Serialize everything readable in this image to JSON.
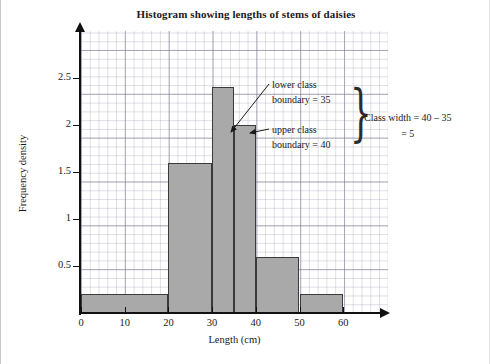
{
  "chart_data": {
    "type": "bar",
    "title": "Histogram showing lengths of stems of daisies",
    "xlabel": "Length (cm)",
    "ylabel": "Frequency density",
    "xlim": [
      0,
      60
    ],
    "ylim": [
      0,
      2.75
    ],
    "grid": true,
    "legend": null,
    "xticks": [
      "0",
      "10",
      "20",
      "30",
      "40",
      "50",
      "60"
    ],
    "xtick_values": [
      0,
      10,
      20,
      30,
      40,
      50,
      60
    ],
    "yticks": [
      "0.5",
      "1",
      "1.5",
      "2",
      "2.5"
    ],
    "ytick_values": [
      0.5,
      1,
      1.5,
      2,
      2.5
    ],
    "bins": [
      {
        "lower": 0,
        "upper": 20,
        "frequency_density": 0.2
      },
      {
        "lower": 20,
        "upper": 30,
        "frequency_density": 1.6
      },
      {
        "lower": 30,
        "upper": 35,
        "frequency_density": 2.4
      },
      {
        "lower": 35,
        "upper": 40,
        "frequency_density": 2.0
      },
      {
        "lower": 40,
        "upper": 50,
        "frequency_density": 0.6
      },
      {
        "lower": 50,
        "upper": 60,
        "frequency_density": 0.2
      }
    ],
    "annotations": [
      {
        "name": "lower-class-boundary",
        "line1": "lower class",
        "line2": "boundary = 35",
        "points_to_x": 35,
        "points_to_y": 2.0
      },
      {
        "name": "upper-class-boundary",
        "line1": "upper class",
        "line2": "boundary = 40",
        "points_to_x": 40,
        "points_to_y": 2.0
      },
      {
        "name": "class-width",
        "line1": "Class width = 40 – 35",
        "line2": "= 5"
      }
    ]
  },
  "chart": {
    "title": "Histogram showing lengths of stems of daisies",
    "xlabel": "Length (cm)",
    "ylabel": "Frequency density",
    "xticks": [
      "0",
      "10",
      "20",
      "30",
      "40",
      "50",
      "60"
    ],
    "yticks": [
      "0.5",
      "1",
      "1.5",
      "2",
      "2.5"
    ]
  },
  "annotations": {
    "lower_class": {
      "line1": "lower class",
      "line2": "boundary = 35"
    },
    "upper_class": {
      "line1": "upper class",
      "line2": "boundary = 40"
    },
    "class_width": {
      "line1": "Class width = 40 – 35",
      "line2": "= 5"
    },
    "brace": "}"
  },
  "colors": {
    "bar_fill": "#a9a9a9",
    "bar_stroke": "#3a3a3a",
    "axis": "#111111",
    "grid_major": "#7878_8c",
    "text": "#1a1a1a"
  }
}
